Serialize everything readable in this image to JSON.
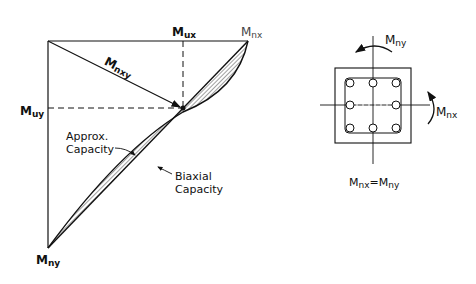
{
  "diagram": {
    "interaction_plot": {
      "labels": {
        "mux": {
          "main": "M",
          "sub": "ux"
        },
        "mnx": {
          "main": "M",
          "sub": "nx"
        },
        "muy": {
          "main": "M",
          "sub": "uy"
        },
        "mny": {
          "main": "M",
          "sub": "ny"
        },
        "mnxy": {
          "main": "M",
          "sub": "nxy"
        },
        "approx_capacity": [
          "Approx.",
          "Capacity"
        ],
        "biaxial_capacity": [
          "Biaxial",
          "Capacity"
        ]
      }
    },
    "column_section": {
      "labels": {
        "mny": {
          "main": "M",
          "sub": "ny"
        },
        "mnx": {
          "main": "M",
          "sub": "nx"
        },
        "equation": {
          "lhs_main": "M",
          "lhs_sub": "nx",
          "eq": "=",
          "rhs_main": "M",
          "rhs_sub": "ny"
        }
      },
      "bar_count": 8
    },
    "colors": {
      "line": "#111111",
      "background": "#ffffff"
    }
  }
}
